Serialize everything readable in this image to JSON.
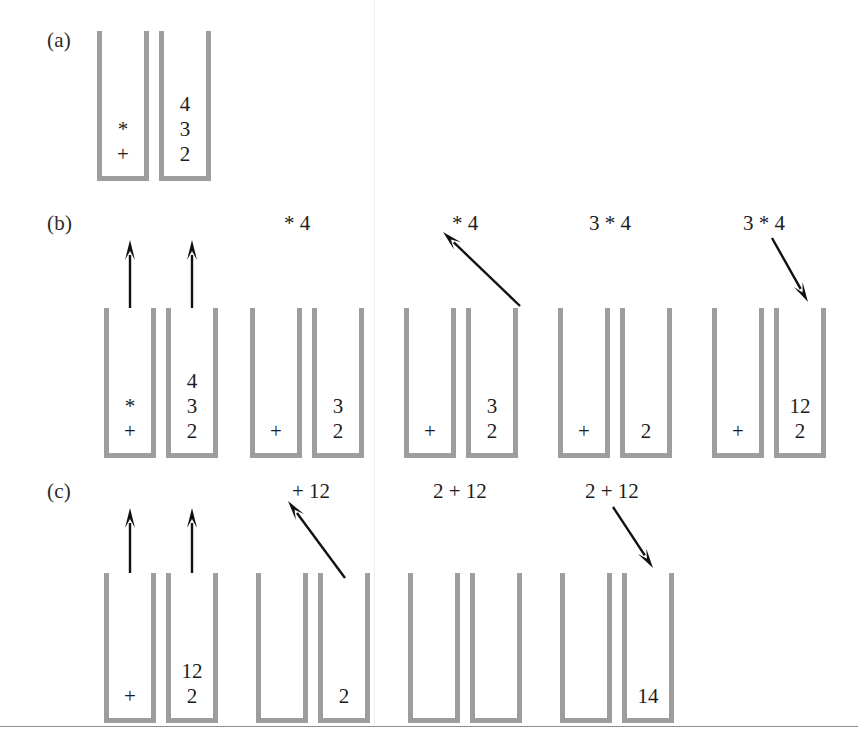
{
  "figure": {
    "colors": {
      "stack_wall": "#9d9d9d",
      "arrow": "#111111",
      "text": "#1d1d1d",
      "background": "#ffffff",
      "rule": "#8e8e8e"
    },
    "bottom_rule_y": 726
  },
  "panels": [
    {
      "id": "a",
      "label": "(a)",
      "label_x": 47,
      "label_y": 30,
      "stack_top": 31,
      "stack_height": 150,
      "steps": [
        {
          "id": "a-step-1",
          "expr": "",
          "expr_x": 0,
          "expr_y": 0,
          "arrows": [],
          "stacks": [
            {
              "name": "operator-stack",
              "x": 97,
              "items": [
                "+",
                "*"
              ]
            },
            {
              "name": "operand-stack",
              "x": 159,
              "items": [
                "2",
                "3",
                "4"
              ]
            }
          ]
        }
      ]
    },
    {
      "id": "b",
      "label": "(b)",
      "label_x": 47,
      "label_y": 213,
      "stack_top": 308,
      "stack_height": 150,
      "steps": [
        {
          "id": "b-step-1",
          "expr": "",
          "expr_x": 0,
          "expr_y": 0,
          "arrows": [
            {
              "name": "pop-arrow-up-operator",
              "type": "up",
              "x1": 130,
              "y1": 308,
              "x2": 130,
              "y2": 240
            },
            {
              "name": "pop-arrow-up-operand",
              "type": "up",
              "x1": 192,
              "y1": 308,
              "x2": 192,
              "y2": 240
            }
          ],
          "stacks": [
            {
              "name": "operator-stack",
              "x": 104,
              "items": [
                "+",
                "*"
              ]
            },
            {
              "name": "operand-stack",
              "x": 166,
              "items": [
                "2",
                "3",
                "4"
              ]
            }
          ]
        },
        {
          "id": "b-step-2",
          "expr": "* 4",
          "expr_x": 284,
          "expr_y": 213,
          "arrows": [],
          "stacks": [
            {
              "name": "operator-stack",
              "x": 250,
              "items": [
                "+"
              ]
            },
            {
              "name": "operand-stack",
              "x": 312,
              "items": [
                "2",
                "3"
              ]
            }
          ]
        },
        {
          "id": "b-step-3",
          "expr": "* 4",
          "expr_x": 452,
          "expr_y": 213,
          "arrows": [
            {
              "name": "pop-arrow-up-left",
              "type": "up-left",
              "x1": 520,
              "y1": 306,
              "x2": 443,
              "y2": 232
            }
          ],
          "stacks": [
            {
              "name": "operator-stack",
              "x": 404,
              "items": [
                "+"
              ]
            },
            {
              "name": "operand-stack",
              "x": 466,
              "items": [
                "2",
                "3"
              ]
            }
          ]
        },
        {
          "id": "b-step-4",
          "expr": "3 * 4",
          "expr_x": 589,
          "expr_y": 213,
          "arrows": [],
          "stacks": [
            {
              "name": "operator-stack",
              "x": 558,
              "items": [
                "+"
              ]
            },
            {
              "name": "operand-stack",
              "x": 620,
              "items": [
                "2"
              ]
            }
          ]
        },
        {
          "id": "b-step-5",
          "expr": "3 * 4",
          "expr_x": 743,
          "expr_y": 213,
          "arrows": [
            {
              "name": "push-arrow-down-right",
              "type": "down-right",
              "x1": 772,
              "y1": 238,
              "x2": 808,
              "y2": 302
            }
          ],
          "stacks": [
            {
              "name": "operator-stack",
              "x": 712,
              "items": [
                "+"
              ]
            },
            {
              "name": "operand-stack",
              "x": 774,
              "items": [
                "2",
                "12"
              ]
            }
          ]
        }
      ]
    },
    {
      "id": "c",
      "label": "(c)",
      "label_x": 47,
      "label_y": 481,
      "stack_top": 573,
      "stack_height": 150,
      "steps": [
        {
          "id": "c-step-1",
          "expr": "",
          "expr_x": 0,
          "expr_y": 0,
          "arrows": [
            {
              "name": "pop-arrow-up-operator",
              "type": "up",
              "x1": 130,
              "y1": 573,
              "x2": 130,
              "y2": 508
            },
            {
              "name": "pop-arrow-up-operand",
              "type": "up",
              "x1": 192,
              "y1": 573,
              "x2": 192,
              "y2": 508
            }
          ],
          "stacks": [
            {
              "name": "operator-stack",
              "x": 104,
              "items": [
                "+"
              ]
            },
            {
              "name": "operand-stack",
              "x": 166,
              "items": [
                "2",
                "12"
              ]
            }
          ]
        },
        {
          "id": "c-step-2",
          "expr": "+ 12",
          "expr_x": 292,
          "expr_y": 481,
          "arrows": [
            {
              "name": "pop-arrow-up-left",
              "type": "up-left",
              "x1": 345,
              "y1": 578,
              "x2": 288,
              "y2": 501
            }
          ],
          "stacks": [
            {
              "name": "operator-stack",
              "x": 256,
              "items": []
            },
            {
              "name": "operand-stack",
              "x": 318,
              "items": [
                "2"
              ]
            }
          ]
        },
        {
          "id": "c-step-3",
          "expr": "2 + 12",
          "expr_x": 433,
          "expr_y": 481,
          "arrows": [],
          "stacks": [
            {
              "name": "operator-stack",
              "x": 408,
              "items": []
            },
            {
              "name": "operand-stack",
              "x": 470,
              "items": []
            }
          ]
        },
        {
          "id": "c-step-4",
          "expr": "2 + 12",
          "expr_x": 585,
          "expr_y": 481,
          "arrows": [
            {
              "name": "push-arrow-down-right",
              "type": "down-right",
              "x1": 613,
              "y1": 507,
              "x2": 653,
              "y2": 568
            }
          ],
          "stacks": [
            {
              "name": "operator-stack",
              "x": 560,
              "items": []
            },
            {
              "name": "operand-stack",
              "x": 622,
              "items": [
                "14"
              ]
            }
          ]
        }
      ]
    }
  ]
}
